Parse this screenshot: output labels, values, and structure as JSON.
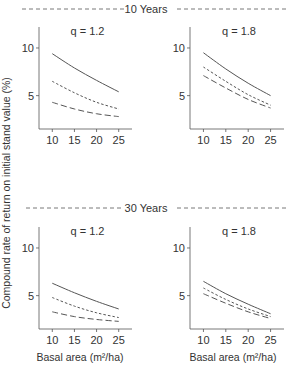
{
  "figure": {
    "ylabel": "Compound rate of return on initial stand value (%)",
    "xlabel": "Basal area (m²/ha)",
    "sections": [
      "10 Years",
      "30 Years"
    ]
  },
  "chart_data": [
    {
      "type": "line",
      "section": "10 Years",
      "title": "q = 1.2",
      "x": [
        10,
        15,
        20,
        25
      ],
      "xlim": [
        7,
        28
      ],
      "ylim": [
        1.5,
        12.2
      ],
      "xticks": [
        10,
        15,
        20,
        25
      ],
      "yticks": [
        5,
        10
      ],
      "series": [
        {
          "name": "solid",
          "style": "solid",
          "values": [
            9.4,
            7.9,
            6.6,
            5.4
          ]
        },
        {
          "name": "short-dash",
          "style": "short-dash",
          "values": [
            6.5,
            5.3,
            4.3,
            3.6
          ]
        },
        {
          "name": "long-dash",
          "style": "long-dash",
          "values": [
            4.3,
            3.6,
            3.1,
            2.8
          ]
        }
      ]
    },
    {
      "type": "line",
      "section": "10 Years",
      "title": "q = 1.8",
      "x": [
        10,
        15,
        20,
        25
      ],
      "xlim": [
        7,
        28
      ],
      "ylim": [
        1.5,
        12.2
      ],
      "xticks": [
        10,
        15,
        20,
        25
      ],
      "yticks": [
        5,
        10
      ],
      "series": [
        {
          "name": "solid",
          "style": "solid",
          "values": [
            9.5,
            7.8,
            6.3,
            5.0
          ]
        },
        {
          "name": "short-dash",
          "style": "short-dash",
          "values": [
            8.0,
            6.5,
            5.1,
            4.0
          ]
        },
        {
          "name": "long-dash",
          "style": "long-dash",
          "values": [
            7.1,
            5.8,
            4.6,
            3.7
          ]
        }
      ]
    },
    {
      "type": "line",
      "section": "30 Years",
      "title": "q = 1.2",
      "x": [
        10,
        15,
        20,
        25
      ],
      "xlim": [
        7,
        28
      ],
      "ylim": [
        1.5,
        12.2
      ],
      "xticks": [
        10,
        15,
        20,
        25
      ],
      "yticks": [
        5,
        10
      ],
      "series": [
        {
          "name": "solid",
          "style": "solid",
          "values": [
            6.3,
            5.3,
            4.4,
            3.6
          ]
        },
        {
          "name": "short-dash",
          "style": "short-dash",
          "values": [
            4.8,
            3.9,
            3.2,
            2.7
          ]
        },
        {
          "name": "long-dash",
          "style": "long-dash",
          "values": [
            3.3,
            2.8,
            2.5,
            2.3
          ]
        }
      ]
    },
    {
      "type": "line",
      "section": "30 Years",
      "title": "q = 1.8",
      "x": [
        10,
        15,
        20,
        25
      ],
      "xlim": [
        7,
        28
      ],
      "ylim": [
        1.5,
        12.2
      ],
      "xticks": [
        10,
        15,
        20,
        25
      ],
      "yticks": [
        5,
        10
      ],
      "series": [
        {
          "name": "solid",
          "style": "solid",
          "values": [
            6.5,
            5.2,
            4.1,
            3.1
          ]
        },
        {
          "name": "short-dash",
          "style": "short-dash",
          "values": [
            5.8,
            4.6,
            3.6,
            2.8
          ]
        },
        {
          "name": "long-dash",
          "style": "long-dash",
          "values": [
            5.2,
            4.2,
            3.3,
            2.6
          ]
        }
      ]
    }
  ]
}
